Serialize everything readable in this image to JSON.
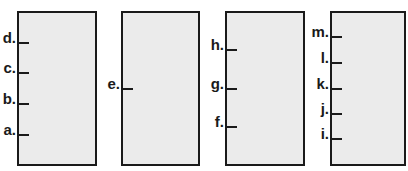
{
  "panels": [
    {
      "id": "panel-1",
      "left": 17,
      "width": 76,
      "ticks": [
        {
          "label": "d.",
          "y": 42
        },
        {
          "label": "c.",
          "y": 72
        },
        {
          "label": "b.",
          "y": 103
        },
        {
          "label": "a.",
          "y": 134
        }
      ]
    },
    {
      "id": "panel-2",
      "left": 121,
      "width": 75,
      "ticks": [
        {
          "label": "e.",
          "y": 88
        }
      ]
    },
    {
      "id": "panel-3",
      "left": 225,
      "width": 76,
      "ticks": [
        {
          "label": "h.",
          "y": 49
        },
        {
          "label": "g.",
          "y": 88
        },
        {
          "label": "f.",
          "y": 126
        }
      ]
    },
    {
      "id": "panel-4",
      "left": 330,
      "width": 72,
      "ticks": [
        {
          "label": "m.",
          "y": 36
        },
        {
          "label": "l.",
          "y": 62
        },
        {
          "label": "k.",
          "y": 88
        },
        {
          "label": "j.",
          "y": 113
        },
        {
          "label": "i.",
          "y": 138
        }
      ]
    }
  ],
  "colors": {
    "fill": "#ebebeb",
    "stroke": "#1a1a1a"
  }
}
